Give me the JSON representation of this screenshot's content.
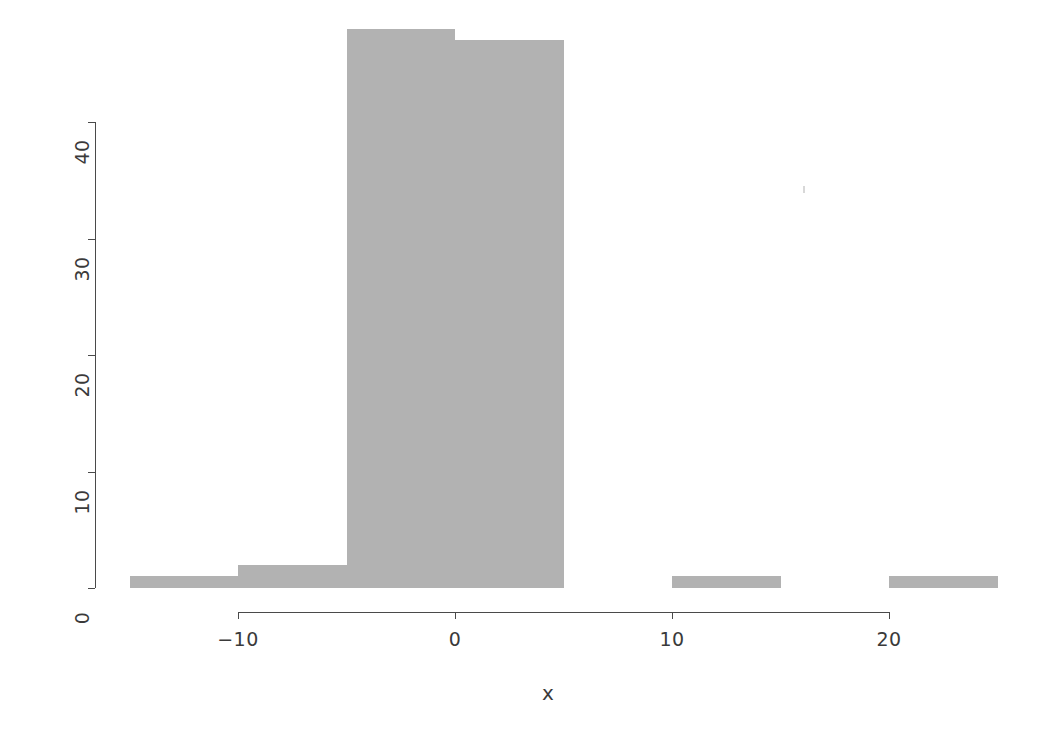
{
  "chart_data": {
    "type": "bar",
    "title": "",
    "subtitle": "",
    "xlabel": "x",
    "ylabel": "",
    "bin_width": 5,
    "bin_edges": [
      -15,
      -10,
      -5,
      0,
      5,
      10,
      15,
      20,
      25
    ],
    "categories": [
      "[-15,-10)",
      "[-10,-5)",
      "[-5,0)",
      "[0,5)",
      "[5,10)",
      "[10,15)",
      "[15,20)",
      "[20,25)"
    ],
    "values": [
      1,
      2,
      48,
      47,
      0,
      1,
      0,
      1
    ],
    "bars": [
      {
        "left": -15,
        "right": -10,
        "count": 1
      },
      {
        "left": -10,
        "right": -5,
        "count": 2
      },
      {
        "left": -5,
        "right": 0,
        "count": 48
      },
      {
        "left": 0,
        "right": 5,
        "count": 47
      },
      {
        "left": 5,
        "right": 10,
        "count": 0
      },
      {
        "left": 10,
        "right": 15,
        "count": 1
      },
      {
        "left": 15,
        "right": 20,
        "count": 0
      },
      {
        "left": 20,
        "right": 25,
        "count": 1
      }
    ],
    "xlim": [
      -15,
      25
    ],
    "ylim": [
      0,
      48
    ],
    "xticks": [
      -10,
      0,
      10,
      20
    ],
    "xtick_labels": [
      "−10",
      "0",
      "10",
      "20"
    ],
    "yticks": [
      0,
      10,
      20,
      30,
      40
    ],
    "ytick_labels": [
      "0",
      "10",
      "20",
      "30",
      "40"
    ],
    "grid": false,
    "legend": null,
    "bar_color": "#b2b2b2",
    "axis_color": "#4a4a4a",
    "background_color": "#ffffff"
  }
}
